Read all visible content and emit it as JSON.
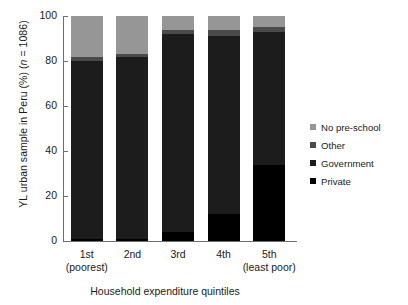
{
  "chart_data": {
    "type": "bar",
    "subtype": "stacked-bar-100-percent",
    "title": "",
    "xlabel": "Household expenditure quintiles",
    "ylabel": "YL urban sample in Peru (%) (n = 1086)",
    "ylabel_parts": {
      "pre": "YL urban sample in Peru (%) (",
      "italic": "n",
      "post": " = 1086)"
    },
    "ylim": [
      0,
      100
    ],
    "yticks": [
      0,
      20,
      40,
      60,
      80,
      100
    ],
    "ytick_labels": [
      "0",
      "20",
      "40",
      "60",
      "80",
      "100"
    ],
    "grid": false,
    "legend_position": "right",
    "categories": [
      "1st",
      "2nd",
      "3rd",
      "4th",
      "5th"
    ],
    "category_labels": [
      {
        "line1": "1st",
        "line2": "(poorest)"
      },
      {
        "line1": "2nd",
        "line2": ""
      },
      {
        "line1": "3rd",
        "line2": ""
      },
      {
        "line1": "4th",
        "line2": ""
      },
      {
        "line1": "5th",
        "line2": "(least poor)"
      }
    ],
    "series": [
      {
        "name": "Private",
        "color": "#000000",
        "values": [
          1,
          1,
          4,
          12,
          34
        ]
      },
      {
        "name": "Government",
        "color": "#1c1c1c",
        "values": [
          79,
          81,
          88,
          79,
          59
        ]
      },
      {
        "name": "Other",
        "color": "#4a4a4a",
        "values": [
          2,
          1,
          2,
          3,
          2
        ]
      },
      {
        "name": "No pre-school",
        "color": "#969696",
        "values": [
          18,
          17,
          6,
          6,
          5
        ]
      }
    ],
    "legend_entries": [
      {
        "label": "No pre-school",
        "color": "#969696"
      },
      {
        "label": "Other",
        "color": "#4a4a4a"
      },
      {
        "label": "Government",
        "color": "#1c1c1c"
      },
      {
        "label": "Private",
        "color": "#000000"
      }
    ],
    "axis_color": "#6e6e6e"
  }
}
